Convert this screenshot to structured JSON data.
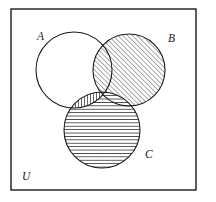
{
  "figure": {
    "type": "venn-diagram",
    "width": 216,
    "height": 202,
    "background_color": "#ffffff",
    "stroke_color": "#1b1b1b",
    "hatch_color": "#2a2a2a"
  },
  "universe": {
    "label": "U",
    "label_x": 22,
    "label_y": 180,
    "rect": {
      "x": 11,
      "y": 9,
      "width": 185,
      "height": 181
    },
    "stroke_width": 1.4,
    "fill": "none"
  },
  "sets": [
    {
      "id": "A",
      "label": "A",
      "label_x": 37,
      "label_y": 40,
      "cx": 74,
      "cy": 70,
      "r": 38,
      "fill": "none",
      "shading": "none",
      "label_position": "inside-top-left"
    },
    {
      "id": "B",
      "label": "B",
      "label_x": 168,
      "label_y": 42,
      "cx": 129,
      "cy": 70,
      "r": 36,
      "fill": "diagonal-hatch",
      "shading": "diagonal lines rising to the right (45 degrees)",
      "label_position": "outside-top-right"
    },
    {
      "id": "C",
      "label": "C",
      "label_x": 145,
      "label_y": 158,
      "cx": 102,
      "cy": 130,
      "r": 38,
      "fill": "horizontal-hatch",
      "shading": "horizontal lines",
      "label_position": "outside-bottom-right"
    }
  ],
  "regions": [
    {
      "name": "A only",
      "shaded": false,
      "pattern": "none"
    },
    {
      "name": "B only",
      "shaded": true,
      "pattern": "diagonal"
    },
    {
      "name": "C only",
      "shaded": true,
      "pattern": "horizontal"
    },
    {
      "name": "A intersect B",
      "shaded": true,
      "pattern": "diagonal"
    },
    {
      "name": "A intersect C",
      "shaded": true,
      "pattern": "vertical"
    },
    {
      "name": "B intersect C",
      "shaded": true,
      "pattern": "horizontal"
    },
    {
      "name": "A intersect B intersect C",
      "shaded": true,
      "pattern": "horizontal"
    },
    {
      "name": "outside all sets (U only)",
      "shaded": false,
      "pattern": "none"
    }
  ],
  "patterns": {
    "diagonal": {
      "angle_deg": -45,
      "spacing": 3.4,
      "line_width": 0.8
    },
    "horizontal": {
      "angle_deg": 0,
      "spacing": 3.4,
      "line_width": 0.8
    },
    "vertical": {
      "angle_deg": 90,
      "spacing": 3.0,
      "line_width": 0.8
    }
  }
}
